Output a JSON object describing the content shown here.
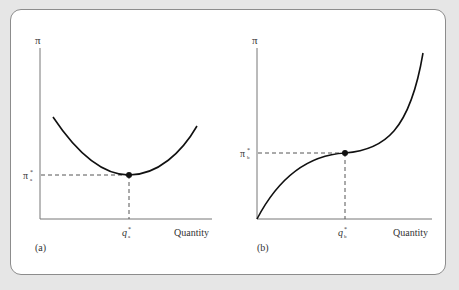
{
  "figure": {
    "panels": [
      {
        "id": "a",
        "label": "(a)",
        "y_axis_label": "π",
        "x_axis_label": "Quantity",
        "y_marker": {
          "symbol": "π",
          "superscript": "*",
          "subscript": "a"
        },
        "x_marker": {
          "symbol": "q",
          "superscript": "*",
          "subscript": "a"
        },
        "curve": "U-shaped profit curve with minimum at (q*a, π*a)"
      },
      {
        "id": "b",
        "label": "(b)",
        "y_axis_label": "π",
        "x_axis_label": "Quantity",
        "y_marker": {
          "symbol": "π",
          "superscript": "*",
          "subscript": "b"
        },
        "x_marker": {
          "symbol": "q",
          "superscript": "*",
          "subscript": "b"
        },
        "curve": "S-shaped profit curve with inflection point at (q*b, π*b)"
      }
    ],
    "colors": {
      "background": "#e6e6e6",
      "panel": "#ffffff",
      "axis": "#777777",
      "curve": "#111111",
      "dashed": "#555555"
    }
  }
}
